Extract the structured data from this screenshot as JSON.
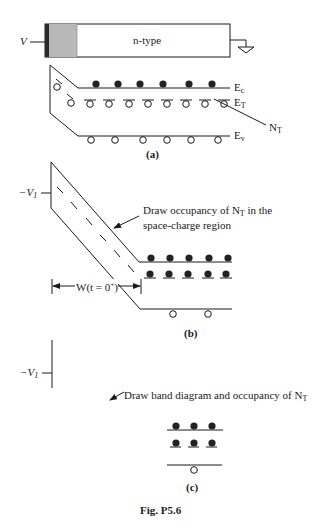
{
  "figure": {
    "caption": "Fig. P5.6",
    "colors": {
      "line": "#1a1a1a",
      "oxide_fill": "#b8b8b8",
      "metal_fill": "#2a2a2a",
      "background": "#ffffff"
    }
  },
  "device": {
    "voltage_label": "V",
    "region_label": "n-type",
    "ground_symbol": "ground-icon"
  },
  "panel_a": {
    "label": "(a)",
    "band_labels": {
      "Ec": "E",
      "Ec_sub": "c",
      "Et": "E",
      "Et_sub": "T",
      "Ev": "E",
      "Ev_sub": "v"
    },
    "trap_label": "N",
    "trap_label_sub": "T",
    "electrons_in_conduction_band": 6,
    "empty_traps": 8,
    "holes_in_valence_band": 6
  },
  "panel_b": {
    "label": "(b)",
    "voltage_label": "−V",
    "voltage_sub": "1",
    "annotation_line1_pre": "Draw occupancy of N",
    "annotation_sub": "T",
    "annotation_line1_post": " in the",
    "annotation_line2": "space-charge region",
    "width_label_pre": "W(t = 0",
    "width_label_sup": "+",
    "width_label_post": ")",
    "electrons_in_conduction_band": 5,
    "filled_traps": 5,
    "holes_in_valence_band": 2
  },
  "panel_c": {
    "label": "(c)",
    "voltage_label": "−V",
    "voltage_sub": "1",
    "annotation_pre": "Draw band diagram and occupancy of N",
    "annotation_sub": "T",
    "electrons_in_conduction_band": 3,
    "filled_traps": 3,
    "holes_in_valence_band": 1
  }
}
